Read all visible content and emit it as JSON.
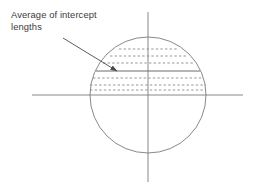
{
  "figure": {
    "name": "average-of-intercept-lengths",
    "width": 253,
    "height": 187,
    "background_color": "#ffffff",
    "stroke_color": "#6b6b6b",
    "text_color": "#3b3b3b",
    "annotation": {
      "label": "Average of intercept\nlengths",
      "line1": "Average of intercept",
      "line2": "lengths",
      "x": 11,
      "y": 9
    },
    "arrow": {
      "name": "leader-arrow",
      "from": {
        "x": 63,
        "y": 38
      },
      "to": {
        "x": 117,
        "y": 71
      },
      "head_length": 7,
      "head_width": 4
    },
    "axes": {
      "horizontal": {
        "x1": 32,
        "y1": 95,
        "x2": 243,
        "y2": 95
      },
      "vertical": {
        "x1": 148,
        "y1": 12,
        "x2": 148,
        "y2": 182
      }
    },
    "circle": {
      "name": "grain-circle",
      "cx": 148,
      "cy": 95,
      "r": 58,
      "left_x": 90,
      "right_x": 206,
      "top_y": 37,
      "bottom_y": 153
    },
    "solid_chord": {
      "name": "average-intercept-chord",
      "y": 71,
      "x1": 96,
      "x2": 200
    },
    "dashed_chords": [
      {
        "name": "intercept-chord-1",
        "y": 49,
        "x1": 119,
        "x2": 177
      },
      {
        "name": "intercept-chord-2",
        "y": 56,
        "x1": 110,
        "x2": 186
      },
      {
        "name": "intercept-chord-3",
        "y": 63,
        "x1": 103,
        "x2": 193
      },
      {
        "name": "intercept-chord-4",
        "y": 78,
        "x1": 93,
        "x2": 203
      },
      {
        "name": "intercept-chord-5",
        "y": 85,
        "x1": 90,
        "x2": 206
      },
      {
        "name": "intercept-chord-6",
        "y": 90,
        "x1": 90,
        "x2": 206
      }
    ]
  }
}
